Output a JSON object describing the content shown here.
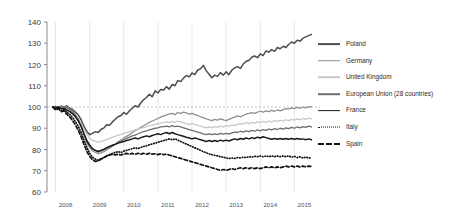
{
  "chart_data": {
    "type": "line",
    "title": "",
    "subtitle": "",
    "xlabel": "",
    "ylabel": "",
    "ylim": [
      60,
      140
    ],
    "yticks": [
      60,
      70,
      80,
      90,
      100,
      110,
      120,
      130,
      140
    ],
    "xlim": [
      2007.75,
      2015.75
    ],
    "xticks": [
      2008,
      2009,
      2010,
      2011,
      2012,
      2013,
      2014,
      2015
    ],
    "xtick_labels": [
      "2008",
      "2009",
      "2010",
      "2011",
      "2012",
      "2013",
      "2014",
      "2015"
    ],
    "grid": "vertical-gridlines-at-year-ticks",
    "reference_line": {
      "value": 100,
      "style": "dashed",
      "color": "#b0b0b0"
    },
    "legend_position": "right",
    "x": [
      2007.92,
      2008.0,
      2008.08,
      2008.17,
      2008.25,
      2008.33,
      2008.42,
      2008.5,
      2008.58,
      2008.67,
      2008.75,
      2008.83,
      2008.92,
      2009.0,
      2009.08,
      2009.17,
      2009.25,
      2009.33,
      2009.42,
      2009.5,
      2009.58,
      2009.67,
      2009.75,
      2009.83,
      2009.92,
      2010.0,
      2010.08,
      2010.17,
      2010.25,
      2010.33,
      2010.42,
      2010.5,
      2010.58,
      2010.67,
      2010.75,
      2010.83,
      2010.92,
      2011.0,
      2011.08,
      2011.17,
      2011.25,
      2011.33,
      2011.42,
      2011.5,
      2011.58,
      2011.67,
      2011.75,
      2011.83,
      2011.92,
      2012.0,
      2012.08,
      2012.17,
      2012.25,
      2012.33,
      2012.42,
      2012.5,
      2012.58,
      2012.67,
      2012.75,
      2012.83,
      2012.92,
      2013.0,
      2013.08,
      2013.17,
      2013.25,
      2013.33,
      2013.42,
      2013.5,
      2013.58,
      2013.67,
      2013.75,
      2013.83,
      2013.92,
      2014.0,
      2014.08,
      2014.17,
      2014.25,
      2014.33,
      2014.42,
      2014.5,
      2014.58,
      2014.67,
      2014.75,
      2014.83,
      2014.92,
      2015.0,
      2015.08,
      2015.17,
      2015.25,
      2015.33,
      2015.42,
      2015.5
    ],
    "series": [
      {
        "name": "Poland",
        "color": "#4d4d4d",
        "width": 1.5,
        "dash": "none",
        "values": [
          100.0,
          100.2,
          99.6,
          100.4,
          99.8,
          100.6,
          99.4,
          98.8,
          97.6,
          96.2,
          94.0,
          91.0,
          88.4,
          87.0,
          87.6,
          88.4,
          88.0,
          89.4,
          90.2,
          91.6,
          91.4,
          93.0,
          94.2,
          95.4,
          96.0,
          97.4,
          96.6,
          98.2,
          99.4,
          100.6,
          100.0,
          102.0,
          103.4,
          104.6,
          106.0,
          104.8,
          107.6,
          106.6,
          108.2,
          108.0,
          109.6,
          108.4,
          110.6,
          110.0,
          112.4,
          112.0,
          113.6,
          114.8,
          114.2,
          116.0,
          115.2,
          117.4,
          118.0,
          119.6,
          117.0,
          115.4,
          113.8,
          115.0,
          114.4,
          116.2,
          115.0,
          116.6,
          115.2,
          117.4,
          118.4,
          119.0,
          118.2,
          120.2,
          121.4,
          122.0,
          123.4,
          124.0,
          123.2,
          125.0,
          124.2,
          126.4,
          125.8,
          127.0,
          126.2,
          128.0,
          127.4,
          128.6,
          128.0,
          129.4,
          130.6,
          130.0,
          131.4,
          131.0,
          132.4,
          133.0,
          133.6,
          134.2
        ]
      },
      {
        "name": "Germany",
        "color": "#8f8f8f",
        "width": 1.3,
        "dash": "none",
        "values": [
          100.0,
          100.4,
          100.0,
          100.6,
          99.6,
          100.2,
          99.0,
          98.0,
          96.4,
          94.2,
          91.0,
          87.0,
          83.2,
          81.0,
          79.4,
          78.6,
          78.0,
          78.4,
          79.0,
          79.8,
          80.6,
          81.6,
          82.4,
          83.6,
          84.4,
          85.4,
          86.2,
          87.0,
          88.0,
          88.8,
          89.6,
          90.4,
          91.2,
          92.0,
          92.8,
          93.4,
          94.0,
          94.6,
          95.2,
          95.8,
          96.2,
          96.8,
          97.0,
          96.4,
          97.4,
          97.0,
          97.6,
          97.2,
          96.6,
          97.0,
          96.4,
          96.0,
          95.4,
          95.0,
          94.4,
          94.0,
          93.6,
          94.2,
          93.8,
          94.4,
          94.0,
          93.6,
          94.2,
          94.8,
          95.2,
          95.8,
          95.4,
          96.0,
          96.6,
          97.0,
          97.4,
          97.0,
          97.6,
          98.0,
          97.6,
          98.2,
          97.8,
          98.4,
          98.0,
          98.6,
          98.2,
          98.8,
          99.2,
          99.0,
          99.6,
          99.2,
          99.8,
          99.4,
          100.0,
          99.6,
          100.2,
          100.0
        ]
      },
      {
        "name": "United Kingdom",
        "color": "#c8c8c8",
        "width": 1.3,
        "dash": "none",
        "values": [
          100.0,
          99.8,
          100.2,
          99.4,
          99.8,
          99.0,
          98.2,
          97.4,
          96.0,
          94.4,
          92.0,
          89.4,
          87.0,
          85.4,
          84.4,
          83.8,
          83.4,
          83.8,
          84.2,
          84.8,
          85.2,
          85.8,
          86.2,
          86.8,
          87.0,
          87.6,
          88.0,
          88.4,
          88.8,
          89.2,
          89.6,
          90.0,
          90.4,
          90.8,
          91.2,
          91.4,
          91.8,
          92.0,
          92.4,
          92.6,
          93.0,
          92.6,
          93.2,
          92.8,
          93.4,
          93.0,
          92.6,
          92.2,
          91.8,
          92.2,
          91.8,
          91.4,
          91.0,
          90.6,
          90.2,
          90.6,
          90.2,
          90.8,
          90.4,
          91.0,
          90.6,
          91.2,
          91.0,
          91.6,
          91.2,
          91.8,
          92.2,
          92.0,
          92.6,
          92.2,
          92.8,
          92.4,
          93.0,
          92.6,
          93.2,
          92.8,
          93.4,
          93.0,
          93.6,
          93.2,
          93.8,
          93.4,
          94.0,
          93.6,
          94.2,
          93.8,
          94.4,
          94.0,
          94.6,
          94.2,
          94.8,
          94.4
        ]
      },
      {
        "name": "European Union (28 countries)",
        "color": "#6e6e6e",
        "width": 1.3,
        "dash": "none",
        "values": [
          100.0,
          100.2,
          99.8,
          100.2,
          99.4,
          99.8,
          98.8,
          97.8,
          96.2,
          94.0,
          91.2,
          87.6,
          84.2,
          82.0,
          80.4,
          79.4,
          78.8,
          79.2,
          79.8,
          80.6,
          81.2,
          82.0,
          82.6,
          83.4,
          84.0,
          84.6,
          85.2,
          85.8,
          86.4,
          86.8,
          87.4,
          88.0,
          88.4,
          88.8,
          89.2,
          89.6,
          90.0,
          90.2,
          90.6,
          90.8,
          91.0,
          90.6,
          91.2,
          90.8,
          91.0,
          90.6,
          90.2,
          89.8,
          89.4,
          89.0,
          88.6,
          88.2,
          87.8,
          87.4,
          87.0,
          87.4,
          87.0,
          87.4,
          87.0,
          87.6,
          87.2,
          87.6,
          87.2,
          87.8,
          88.2,
          88.0,
          88.6,
          88.2,
          88.8,
          88.4,
          89.0,
          88.6,
          89.2,
          88.8,
          89.4,
          89.0,
          89.6,
          89.2,
          89.8,
          89.4,
          90.0,
          89.6,
          90.2,
          89.8,
          90.4,
          90.0,
          90.6,
          90.2,
          90.8,
          90.4,
          91.0,
          90.6
        ]
      },
      {
        "name": "France",
        "color": "#1a1a1a",
        "width": 1.5,
        "dash": "none",
        "values": [
          100.0,
          99.6,
          100.0,
          99.2,
          99.4,
          98.6,
          97.8,
          96.8,
          95.4,
          93.4,
          90.8,
          87.4,
          84.0,
          82.0,
          80.4,
          79.6,
          79.2,
          79.6,
          80.2,
          80.8,
          81.4,
          82.0,
          82.4,
          83.0,
          83.4,
          83.8,
          84.2,
          84.6,
          85.0,
          85.4,
          85.0,
          85.6,
          86.0,
          86.4,
          86.0,
          86.6,
          87.0,
          87.4,
          87.0,
          87.6,
          88.0,
          87.4,
          88.0,
          87.4,
          87.0,
          86.6,
          86.2,
          85.8,
          85.4,
          85.0,
          85.4,
          85.0,
          84.6,
          84.2,
          83.8,
          84.2,
          83.8,
          84.2,
          83.8,
          84.4,
          84.0,
          84.4,
          84.0,
          84.6,
          85.0,
          84.6,
          85.2,
          84.8,
          85.4,
          85.0,
          85.6,
          85.2,
          85.8,
          85.4,
          86.0,
          85.6,
          85.2,
          84.8,
          85.2,
          84.8,
          85.2,
          84.8,
          85.2,
          84.8,
          85.2,
          84.8,
          85.2,
          84.8,
          85.0,
          84.6,
          85.0,
          84.6
        ]
      },
      {
        "name": "Italy",
        "color": "#111111",
        "width": 1.5,
        "dash": "dotted",
        "values": [
          100.0,
          99.0,
          99.6,
          98.4,
          98.8,
          97.6,
          96.4,
          95.0,
          93.2,
          90.8,
          88.0,
          84.6,
          81.0,
          78.2,
          76.4,
          75.4,
          75.0,
          75.6,
          76.2,
          77.0,
          77.6,
          78.2,
          78.6,
          79.0,
          78.6,
          79.2,
          79.6,
          80.0,
          80.4,
          80.8,
          80.4,
          81.0,
          81.4,
          81.8,
          82.2,
          82.6,
          83.0,
          83.4,
          83.8,
          84.2,
          84.6,
          85.0,
          84.6,
          85.0,
          84.4,
          83.8,
          83.2,
          82.6,
          82.0,
          81.4,
          80.8,
          80.2,
          79.6,
          79.0,
          78.4,
          78.0,
          77.6,
          77.2,
          77.0,
          76.6,
          76.4,
          76.0,
          75.8,
          76.0,
          75.8,
          76.2,
          76.0,
          76.4,
          76.2,
          76.6,
          76.4,
          76.8,
          76.6,
          77.0,
          76.6,
          77.0,
          76.6,
          77.0,
          76.6,
          77.0,
          76.6,
          77.0,
          76.6,
          77.0,
          76.4,
          76.8,
          76.2,
          76.6,
          76.0,
          76.4,
          76.0,
          76.2
        ]
      },
      {
        "name": "Spain",
        "color": "#111111",
        "width": 1.7,
        "dash": "dashed",
        "values": [
          100.0,
          98.6,
          99.2,
          97.8,
          98.2,
          96.6,
          95.2,
          93.6,
          91.6,
          89.0,
          86.0,
          82.6,
          79.0,
          76.8,
          75.2,
          74.4,
          74.6,
          75.4,
          76.2,
          77.0,
          77.4,
          77.8,
          77.4,
          77.8,
          77.4,
          77.8,
          78.2,
          77.8,
          78.2,
          77.8,
          78.2,
          77.8,
          78.2,
          77.8,
          78.2,
          77.8,
          78.0,
          77.6,
          78.0,
          77.6,
          77.8,
          77.4,
          77.0,
          76.6,
          76.2,
          75.8,
          75.4,
          75.0,
          74.6,
          74.2,
          73.8,
          73.4,
          73.0,
          72.6,
          72.2,
          71.8,
          71.4,
          71.0,
          70.6,
          70.2,
          70.6,
          70.2,
          70.6,
          71.0,
          70.6,
          71.0,
          71.4,
          71.0,
          71.4,
          71.0,
          71.4,
          71.0,
          71.4,
          71.0,
          71.4,
          71.8,
          71.4,
          71.8,
          71.4,
          71.8,
          71.4,
          71.8,
          72.2,
          71.8,
          72.2,
          71.8,
          72.2,
          71.8,
          72.2,
          71.8,
          72.2,
          72.0
        ]
      }
    ]
  },
  "legend": {
    "items": [
      {
        "label": "Poland"
      },
      {
        "label": "Germany"
      },
      {
        "label": "United Kingdom"
      },
      {
        "label": "European Union (28 countries)"
      },
      {
        "label": "France"
      },
      {
        "label": "Italy"
      },
      {
        "label": "Spain"
      }
    ]
  }
}
